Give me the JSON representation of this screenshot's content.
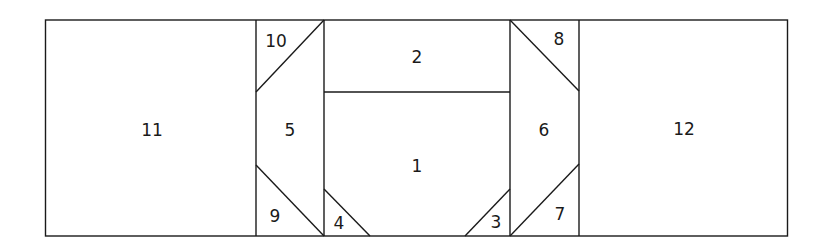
{
  "diagram": {
    "type": "quilt-block-piecing-layout",
    "stroke_color": "#1a1a1a",
    "background": "#ffffff",
    "pieces": [
      {
        "id": "11",
        "label": "11",
        "x": 152,
        "y": 130
      },
      {
        "id": "10",
        "label": "10",
        "x": 276,
        "y": 41
      },
      {
        "id": "5",
        "label": "5",
        "x": 290,
        "y": 130
      },
      {
        "id": "9",
        "label": "9",
        "x": 275,
        "y": 216
      },
      {
        "id": "2",
        "label": "2",
        "x": 417,
        "y": 57
      },
      {
        "id": "1",
        "label": "1",
        "x": 417,
        "y": 166
      },
      {
        "id": "4",
        "label": "4",
        "x": 339,
        "y": 223
      },
      {
        "id": "3",
        "label": "3",
        "x": 496,
        "y": 222
      },
      {
        "id": "6",
        "label": "6",
        "x": 544,
        "y": 130
      },
      {
        "id": "8",
        "label": "8",
        "x": 559,
        "y": 39
      },
      {
        "id": "7",
        "label": "7",
        "x": 560,
        "y": 214
      },
      {
        "id": "12",
        "label": "12",
        "x": 684,
        "y": 129
      }
    ]
  }
}
